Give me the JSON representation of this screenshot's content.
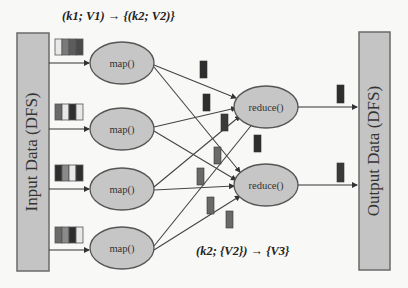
{
  "diagram": {
    "title_formula_top": "(k1; V1) → {(k2; V2)}",
    "title_formula_bottom": "(k2; {V2}) → {V3}",
    "input_box": {
      "label": "Input Data (DFS)"
    },
    "output_box": {
      "label": "Output Data (DFS)"
    },
    "map_nodes": [
      {
        "label": "map()"
      },
      {
        "label": "map()"
      },
      {
        "label": "map()"
      },
      {
        "label": "map()"
      }
    ],
    "reduce_nodes": [
      {
        "label": "reduce()"
      },
      {
        "label": "reduce()"
      }
    ],
    "colors": {
      "box_fill": "#c4c4c4",
      "box_stroke": "#6a6a6a",
      "node_fill": "#c6c6c6",
      "node_stroke": "#555555",
      "line": "#444444",
      "block_dark": "#2e2e2e",
      "block_mid": "#5c5c5c",
      "block_light": "#9a9a9a",
      "block_white": "#e8e8e8"
    }
  }
}
